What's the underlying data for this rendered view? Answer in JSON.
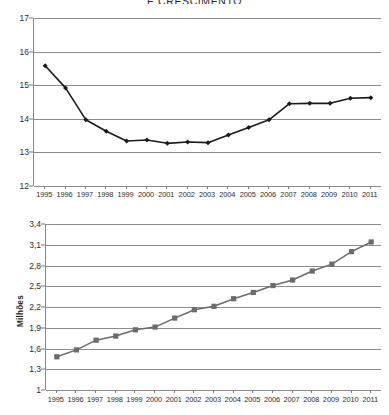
{
  "document": {
    "language": "pt",
    "decimal_separator": ","
  },
  "chart_data": [
    {
      "id": "chart-top",
      "type": "line",
      "title": "E CRESCIMENTO",
      "title_clipped": true,
      "xlabel": "",
      "ylabel": "",
      "ylim": [
        12,
        17
      ],
      "yticks": [
        "12",
        "13",
        "14",
        "15",
        "16",
        "17"
      ],
      "grid": true,
      "legend": "none",
      "marker": "diamond",
      "marker_color": "#1a1a1a",
      "line_color": "#1a1a1a",
      "categories": [
        "1995",
        "1996",
        "1997",
        "1998",
        "1999",
        "2000",
        "2001",
        "2002",
        "2003",
        "2004",
        "2005",
        "2006",
        "2007",
        "2008",
        "2009",
        "2010",
        "2011"
      ],
      "values": [
        15.58,
        14.92,
        13.97,
        13.63,
        13.34,
        13.37,
        13.27,
        13.31,
        13.29,
        13.52,
        13.74,
        13.97,
        14.45,
        14.46,
        14.46,
        14.61,
        14.63
      ]
    },
    {
      "id": "chart-bottom",
      "type": "line",
      "title": "",
      "xlabel": "",
      "ylabel": "Milhões",
      "ylim": [
        1,
        3.4
      ],
      "yticks": [
        "3,4",
        "3,1",
        "2,8",
        "2,5",
        "2,2",
        "1,9",
        "1,6",
        "1,3",
        "1"
      ],
      "grid": true,
      "legend": "none",
      "marker": "square",
      "marker_color": "#6b6b6b",
      "line_color": "#6b6b6b",
      "categories": [
        "1995",
        "1996",
        "1997",
        "1998",
        "1999",
        "2000",
        "2001",
        "2002",
        "2003",
        "2004",
        "2005",
        "2006",
        "2007",
        "2008",
        "2009",
        "2010",
        "2011"
      ],
      "values": [
        1.48,
        1.58,
        1.72,
        1.78,
        1.87,
        1.91,
        2.04,
        2.16,
        2.21,
        2.32,
        2.41,
        2.51,
        2.59,
        2.72,
        2.82,
        3.0,
        3.14
      ]
    }
  ]
}
